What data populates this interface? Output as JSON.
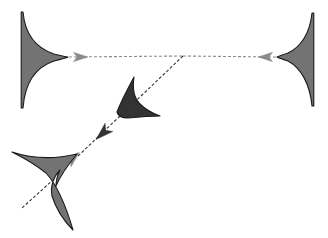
{
  "canvas": {
    "width": 328,
    "height": 238,
    "background_color": "#ffffff",
    "title": "Dart shape flow diagram"
  },
  "palette": {
    "shape_fill_light": "#737373",
    "shape_fill_dark": "#333333",
    "shape_stroke": "#1a1a1a",
    "connector_light": "#8a8a8a",
    "connector_dark": "#333333",
    "background": "#ffffff"
  },
  "shapes": [
    {
      "id": "shape-top-left",
      "label": "top-left fin",
      "fill": "#737373",
      "stroke": "#1a1a1a",
      "anchor_x": 22,
      "anchor_y": 57,
      "tip_x": 68,
      "tip_y": 57,
      "span_top": 12,
      "span_bottom": 108,
      "orientation": "points-right",
      "path": "M 23,12 C 25,34 36,48 54,54 C 62,56 66,57 68,57 C 66,58 62,59 54,61 C 36,67 25,82 23,108 L 21.2,108 L 21.2,12 Z"
    },
    {
      "id": "shape-top-right",
      "label": "top-right fin",
      "fill": "#737373",
      "stroke": "#1a1a1a",
      "anchor_x": 313,
      "anchor_y": 57,
      "tip_x": 277,
      "tip_y": 57,
      "span_top": 13,
      "span_bottom": 106,
      "orientation": "points-left",
      "path": "M 312,13 C 310,33 301,47 288,53 C 282,55 279,56 277,57 C 279,58 282,59 288,61 C 301,68 310,84 312,106 L 313.8,106 L 313.8,13 Z"
    },
    {
      "id": "shape-middle-dart",
      "label": "middle dart",
      "fill": "#333333",
      "stroke": "#1a1a1a",
      "tip_x": 134,
      "tip_y": 77,
      "span_left": 117,
      "span_right": 160,
      "span_top": 77,
      "span_bottom": 118,
      "orientation": "points-up-left",
      "path": "M 134,77 C 132,90 134,98 140,104 C 147,111 154,114 160,116 C 150,116 138,117 128,118 C 122,118 118,116 117,112 C 120,104 126,92 134,77 Z"
    },
    {
      "id": "shape-bottom-left-dart",
      "label": "bottom-left three-point dart",
      "fill": "#737373",
      "stroke": "#1a1a1a",
      "anchor_x": 75,
      "anchor_y": 155,
      "span_left": 12,
      "span_right": 80,
      "span_top": 151,
      "span_bottom": 230,
      "orientation": "points-up-right",
      "path": "M 77,154 C 68,165 60,176 56,186 C 56,180 58,174 60,170 C 54,176 50,186 52,196 C 56,209 64,221 73,230 C 66,206 58,186 46,173 C 36,165 24,158 12,152 C 30,158 52,160 77,154 Z"
    }
  ],
  "connectors": [
    {
      "id": "connector-top-horizontal-left",
      "label": "top-left to junction",
      "from": "shape-top-left",
      "to": "junction",
      "color": "#8a8a8a",
      "style": "dashed",
      "dash": "3 2",
      "x1": 69,
      "y1": 57,
      "x2": 183,
      "y2": 56,
      "arrow_at": "start",
      "arrow_direction": "right",
      "arrow_color": "#8a8a8a"
    },
    {
      "id": "connector-top-horizontal-right",
      "label": "junction to top-right",
      "from": "junction",
      "to": "shape-top-right",
      "color": "#8a8a8a",
      "style": "dashed",
      "dash": "3 2",
      "x1": 183,
      "y1": 56,
      "x2": 276,
      "y2": 57,
      "arrow_at": "end",
      "arrow_direction": "left",
      "arrow_color": "#8a8a8a"
    },
    {
      "id": "connector-diagonal-upper",
      "label": "junction to middle dart",
      "from": "junction",
      "to": "shape-middle-dart",
      "color": "#333333",
      "style": "dashed",
      "dash": "3 2",
      "x1": 183,
      "y1": 56,
      "x2": 120,
      "y2": 116,
      "arrow_at": "none",
      "arrow_direction": "none",
      "arrow_color": "#333333"
    },
    {
      "id": "connector-diagonal-lower",
      "label": "middle dart to bottom-left dart",
      "from": "shape-middle-dart",
      "to": "shape-bottom-left-dart",
      "color": "#333333",
      "style": "dashed",
      "dash": "3 2",
      "x1": 120,
      "y1": 116,
      "x2": 78,
      "y2": 156,
      "arrow_at": "both",
      "arrow_direction": "down-left",
      "arrow_color": "#333333"
    },
    {
      "id": "connector-bottom-tail",
      "label": "bottom-left dart tail",
      "from": "shape-bottom-left-dart",
      "to": "open",
      "color": "#333333",
      "style": "dashed",
      "dash": "3 2",
      "x1": 54,
      "y1": 179,
      "x2": 22,
      "y2": 208,
      "arrow_at": "none",
      "arrow_direction": "none",
      "arrow_color": "#333333"
    }
  ],
  "arrowheads": [
    {
      "id": "arrowhead-top-left",
      "label": "rightward arrowhead near top-left fin",
      "x": 79,
      "y": 57,
      "angle": 0,
      "color": "#8a8a8a",
      "size": 9
    },
    {
      "id": "arrowhead-top-right",
      "label": "leftward arrowhead near top-right fin",
      "x": 267,
      "y": 57,
      "angle": 180,
      "color": "#8a8a8a",
      "size": 9
    },
    {
      "id": "arrowhead-diagonal-middle",
      "label": "down-left arrowhead below middle dart",
      "x": 104,
      "y": 132,
      "angle": 137,
      "color": "#333333",
      "size": 11
    },
    {
      "id": "arrowhead-diagonal-lower",
      "label": "up-right arrowhead at bottom-left dart tip",
      "x": 72,
      "y": 159,
      "angle": -43,
      "color": "#8a8a8a",
      "size": 10
    }
  ]
}
